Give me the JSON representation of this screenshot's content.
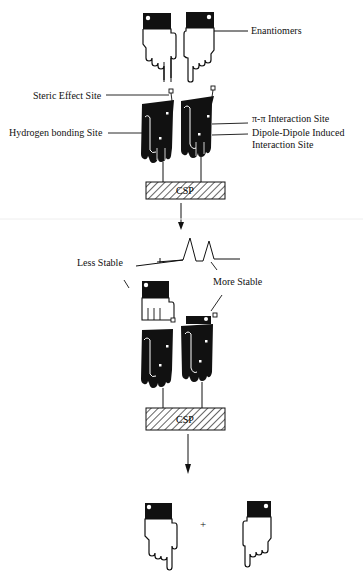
{
  "diagram": {
    "labels": {
      "enantiomers": "Enantiomers",
      "steric": "Steric Effect Site",
      "hbond": "Hydrogen bonding Site",
      "pipi": "π-π Interaction Site",
      "dipole_line1": "Dipole-Dipole Induced",
      "dipole_line2": "Interaction Site",
      "less_stable": "Less Stable",
      "more_stable": "More Stable",
      "plus": "+"
    },
    "csp_top": "CSP",
    "csp_bottom": "CSP",
    "colors": {
      "ink": "#111111",
      "paper": "#ffffff"
    }
  }
}
